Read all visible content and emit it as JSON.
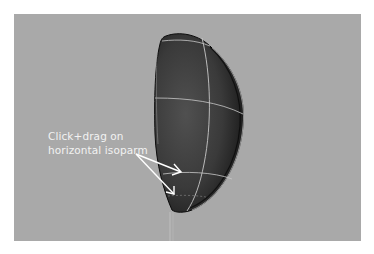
{
  "viewport": {
    "background_color": "#a9a9a9",
    "object": {
      "type": "half-sphere-nurbs-surface",
      "fill_dark": "#1a1a1a",
      "fill_mid": "#4a4a4a",
      "isoparm_color": "#c8c8c8"
    }
  },
  "annotation": {
    "line1": "Click+drag on",
    "line2": "horizontal isoparm",
    "text_color": "#f2f2f2",
    "arrow_color": "#ffffff"
  }
}
